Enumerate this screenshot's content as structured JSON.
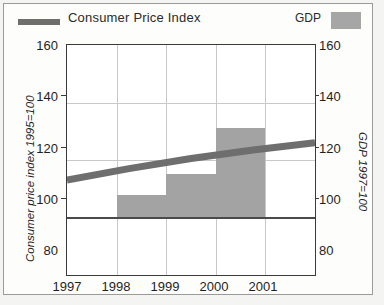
{
  "legend": {
    "line_label": "Consumer Price Index",
    "line_color": "#6e6e6e",
    "bar_label": "GDP",
    "bar_color": "#a6a6a6",
    "forecast_color": "#dcdcdc"
  },
  "axes": {
    "left_title": "Consumer price index 1995=100",
    "right_title": "GDP 1997=100",
    "y_ticks": [
      "160",
      "140",
      "120",
      "100",
      "80"
    ],
    "y_ticks_right": [
      "160",
      "140",
      "120",
      "100",
      "80"
    ],
    "x_ticks": [
      "1997",
      "1998",
      "1999",
      "2000",
      "2001"
    ]
  },
  "chart_data": {
    "type": "bar",
    "title": "",
    "subtitle": "",
    "xlabel": "",
    "ylabel": "Consumer price index 1995=100",
    "y2label": "GDP 1997=100",
    "categories": [
      "1997",
      "1998",
      "1999",
      "2000",
      "2001"
    ],
    "ylim": [
      80,
      160
    ],
    "y2lim": [
      80,
      160
    ],
    "yticks": [
      80,
      100,
      120,
      140,
      160
    ],
    "grid": true,
    "legend_position": "top",
    "series": [
      {
        "name": "GDP",
        "type": "bar",
        "axis": "right",
        "baseline": 100,
        "values": [
          100,
          108,
          115,
          131,
          100
        ],
        "forecast_flags": [
          false,
          false,
          false,
          false,
          true
        ],
        "color": "#a3a3a3",
        "forecast_color": "#dcdcdc"
      },
      {
        "name": "Consumer Price Index",
        "type": "line",
        "axis": "left",
        "values": [
          113,
          117,
          120.5,
          123.5,
          126
        ],
        "color": "#6e6e6e"
      }
    ]
  }
}
